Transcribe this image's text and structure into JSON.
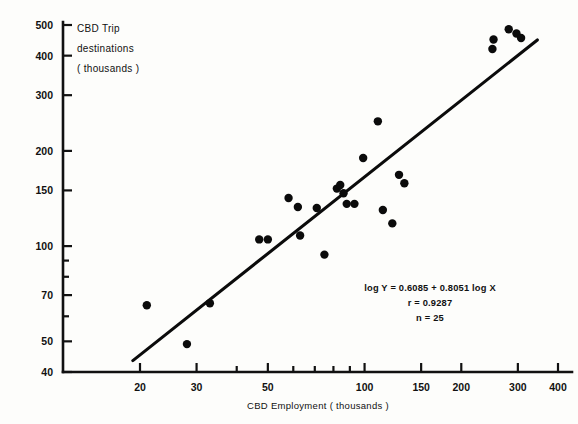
{
  "chart_data": {
    "type": "scatter",
    "title": "",
    "xlabel": "CBD Employment ( thousands )",
    "ylabel_lines": [
      "CBD Trip",
      "destinations",
      "( thousands )"
    ],
    "xscale": "log",
    "yscale": "log",
    "xlim": [
      17,
      400
    ],
    "ylim": [
      40,
      520
    ],
    "grid": false,
    "legend": "none",
    "xticks": [
      20,
      30,
      50,
      100,
      150,
      200,
      300,
      400
    ],
    "xtick_labels": [
      "20",
      "30",
      "50",
      "100",
      "150",
      "200",
      "300",
      "400"
    ],
    "xminor_ticks": [
      40,
      60,
      70,
      80,
      90
    ],
    "yticks": [
      40,
      50,
      70,
      100,
      150,
      200,
      300,
      400,
      500
    ],
    "ytick_labels": [
      "40",
      "50",
      "70",
      "100",
      "150",
      "200",
      "300",
      "400",
      "500"
    ],
    "yminor_ticks": [
      60,
      80,
      90
    ],
    "points": [
      {
        "x": 21,
        "y": 65
      },
      {
        "x": 28,
        "y": 49
      },
      {
        "x": 33,
        "y": 66
      },
      {
        "x": 47,
        "y": 105
      },
      {
        "x": 50,
        "y": 105
      },
      {
        "x": 58,
        "y": 142
      },
      {
        "x": 62,
        "y": 133
      },
      {
        "x": 63,
        "y": 108
      },
      {
        "x": 71,
        "y": 132
      },
      {
        "x": 75,
        "y": 94
      },
      {
        "x": 82,
        "y": 152
      },
      {
        "x": 84,
        "y": 156
      },
      {
        "x": 86,
        "y": 147
      },
      {
        "x": 88,
        "y": 136
      },
      {
        "x": 93,
        "y": 136
      },
      {
        "x": 99,
        "y": 190
      },
      {
        "x": 110,
        "y": 248
      },
      {
        "x": 114,
        "y": 130
      },
      {
        "x": 122,
        "y": 118
      },
      {
        "x": 128,
        "y": 168
      },
      {
        "x": 133,
        "y": 158
      },
      {
        "x": 250,
        "y": 420
      },
      {
        "x": 252,
        "y": 450
      },
      {
        "x": 281,
        "y": 485
      },
      {
        "x": 297,
        "y": 470
      },
      {
        "x": 307,
        "y": 455
      }
    ],
    "regression": {
      "equation": "log Y = 0.6085 + 0.8051 log X",
      "r_label": "r = 0.9287",
      "n_label": "n = 25",
      "intercept_log10": 0.6085,
      "slope": 0.8051,
      "r": 0.9287,
      "n": 25,
      "x_start": 19,
      "x_end": 345
    },
    "colors": {
      "point": "#0b0b0b",
      "line": "#0b0b0b",
      "axis": "#111111",
      "background": "#fdfdfb"
    }
  }
}
